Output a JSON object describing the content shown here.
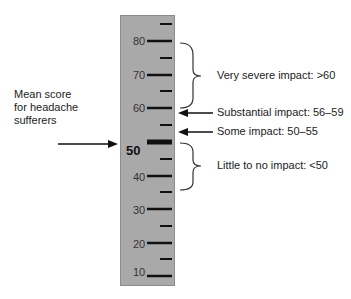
{
  "diagram": {
    "title": "",
    "scale": {
      "min": 10,
      "max": 85,
      "major_ticks": [
        10,
        20,
        30,
        40,
        50,
        60,
        70,
        80
      ],
      "minor_ticks": [
        15,
        25,
        35,
        45,
        55,
        65,
        75,
        85
      ],
      "labels": [
        {
          "value": 80,
          "text": "80"
        },
        {
          "value": 70,
          "text": "70"
        },
        {
          "value": 60,
          "text": "60"
        },
        {
          "value": 50,
          "text": "50"
        },
        {
          "value": 40,
          "text": "40"
        },
        {
          "value": 30,
          "text": "30"
        },
        {
          "value": 20,
          "text": "20"
        },
        {
          "value": 10,
          "text": "10"
        }
      ],
      "highlight_value": 50
    },
    "left_annotation": {
      "line1": "Mean score",
      "line2": "for headache",
      "line3": "sufferers",
      "points_to": 50
    },
    "right_annotations": [
      {
        "type": "brace",
        "from": 60,
        "to": 80,
        "text": "Very severe impact: >60"
      },
      {
        "type": "arrow",
        "at": 60,
        "text": "Substantial impact: 56–59"
      },
      {
        "type": "arrow",
        "at": 55,
        "text": "Some impact: 50–55"
      },
      {
        "type": "brace",
        "from": 40,
        "to": 50,
        "text": "Little to no impact: <50"
      }
    ],
    "colors": {
      "ruler": "#a9a9a9",
      "ticks": "#111111",
      "text": "#222222"
    }
  }
}
